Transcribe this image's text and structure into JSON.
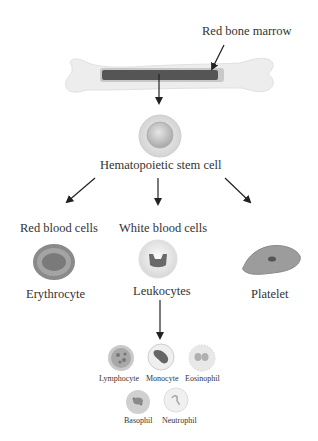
{
  "diagram": {
    "source": {
      "label": "Red bone marrow"
    },
    "stem": {
      "label": "Hematopoietic stem cell"
    },
    "branches": [
      {
        "category": "Red blood cells",
        "cell": "Erythrocyte"
      },
      {
        "category": "White blood cells",
        "cell": "Leukocytes"
      },
      {
        "category": "",
        "cell": "Platelet"
      }
    ],
    "leukocyte_types": [
      "Lymphocyte",
      "Monocyte",
      "Eosinophil",
      "Basophil",
      "Neutrophil"
    ],
    "colors": {
      "bone": "#ececec",
      "marrow": "#5a5a5a",
      "arrow": "#222222",
      "cell_gray": "#9a9a9a"
    }
  }
}
